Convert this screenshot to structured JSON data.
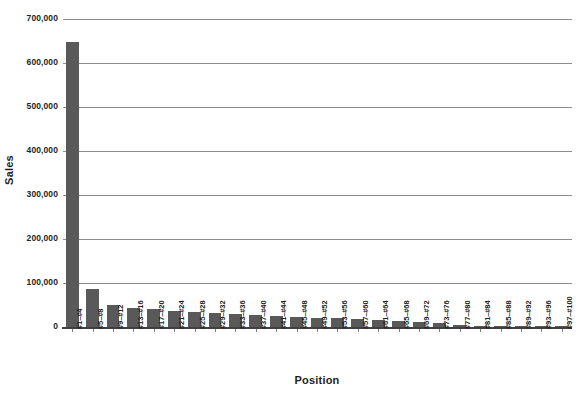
{
  "chart_data": {
    "type": "bar",
    "title": "",
    "xlabel": "Position",
    "ylabel": "Sales",
    "ylim": [
      0,
      700000
    ],
    "ytick_values": [
      0,
      100000,
      200000,
      300000,
      400000,
      500000,
      600000,
      700000
    ],
    "ytick_labels": [
      "0",
      "100,000",
      "200,000",
      "300,000",
      "400,000",
      "500,000",
      "600,000",
      "700,000"
    ],
    "grid": true,
    "legend": null,
    "bar_color": "#595959",
    "gridline_color": "#8c8c8c",
    "axis_color": "#404040",
    "categories": [
      "#1–#4",
      "#5–#8",
      "#9–#12",
      "#13–#16",
      "#17–#20",
      "#21–#24",
      "#25–#28",
      "#29–#32",
      "#33–#36",
      "#37–#40",
      "#41–#44",
      "#45–#48",
      "#49–#52",
      "#53–#56",
      "#57–#60",
      "#61–#64",
      "#65–#68",
      "#69–#72",
      "#73–#76",
      "#77–#80",
      "#81–#84",
      "#85–#88",
      "#89–#92",
      "#93–#96",
      "#97–#100"
    ],
    "values": [
      648000,
      86000,
      50000,
      44000,
      40000,
      37000,
      33000,
      31000,
      29000,
      27000,
      25000,
      23000,
      21000,
      20000,
      18000,
      16000,
      14000,
      11000,
      8000,
      5000,
      2500,
      1200,
      600,
      300,
      200
    ]
  }
}
